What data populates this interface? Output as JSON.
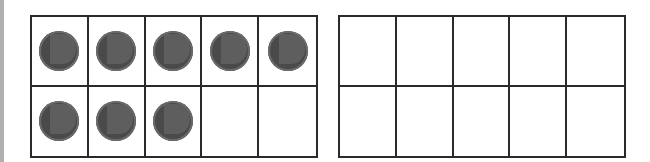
{
  "ten_frames": [
    {
      "cells": [
        true,
        true,
        true,
        true,
        true,
        true,
        true,
        true,
        false,
        false
      ],
      "count": 8
    },
    {
      "cells": [
        false,
        false,
        false,
        false,
        false,
        false,
        false,
        false,
        false,
        false
      ],
      "count": 0
    }
  ],
  "colors": {
    "counter": "#4a4a4a",
    "grid": "#2a2a2a"
  }
}
